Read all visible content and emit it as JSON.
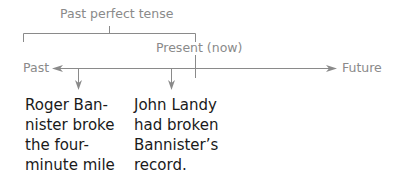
{
  "diagram": {
    "bracket_label": "Past perfect tense",
    "present_label": "Present (now)",
    "past_label": "Past",
    "future_label": "Future",
    "events": [
      {
        "lines": [
          "Roger Ban-",
          "nister broke",
          "the four-",
          "minute mile"
        ]
      },
      {
        "lines": [
          "John Landy",
          "had broken",
          "Bannister’s",
          "record."
        ]
      }
    ],
    "colors": {
      "line": "#8a8a8a",
      "text": "#1a1a1a",
      "label": "#8a8a8a"
    }
  }
}
